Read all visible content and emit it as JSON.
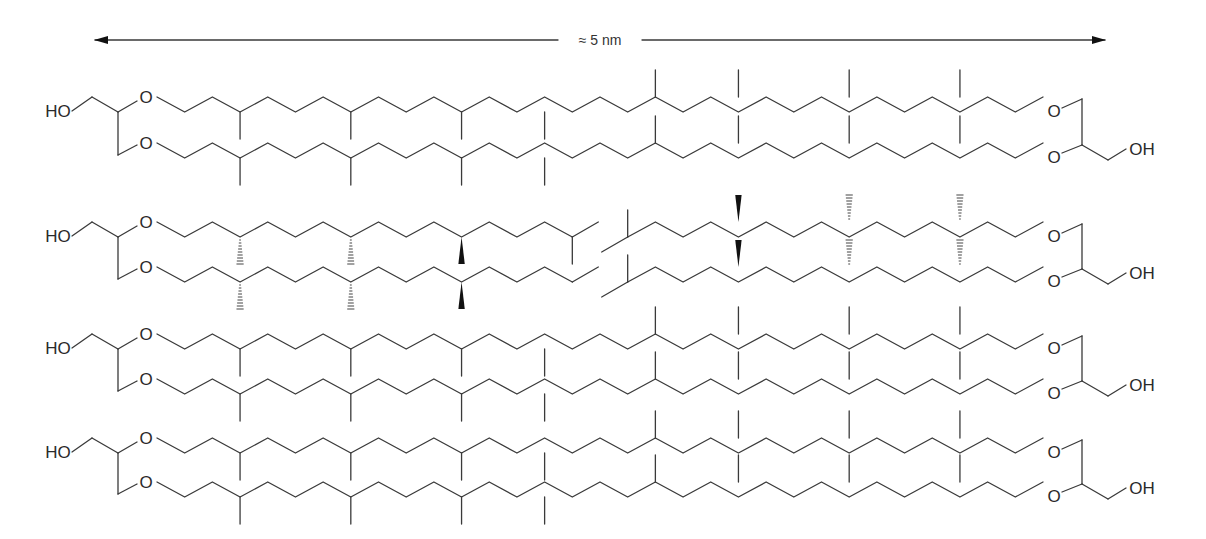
{
  "diagram": {
    "type": "chemical-structure",
    "scale_bar": {
      "label": "≈ 5 nm",
      "x1": 95,
      "x2": 1105,
      "y": 40,
      "label_x": 600
    },
    "colors": {
      "bond": "#3a3a3a",
      "text": "#2a2a2a",
      "background": "#ffffff"
    },
    "geometry": {
      "step_x": 27.4,
      "amplitude": 15,
      "branch_length": 27
    },
    "rows": [
      {
        "id": "row-1",
        "name": "caldarchaeol-like tetraether",
        "left_label": "HO",
        "right_label": "OH",
        "ether_label": "O",
        "top_chain_y": 97,
        "bottom_chain_y": 143,
        "left_x": 147,
        "right_x": 1055,
        "stereo": "none",
        "split": false
      },
      {
        "id": "row-2",
        "name": "archaeol diethers with stereochemistry",
        "left_label": "HO",
        "right_label": "OH",
        "ether_label": "O",
        "top_chain_y": 222,
        "bottom_chain_y": 267,
        "left_x": 147,
        "right_x": 1055,
        "stereo": "wedge-hash",
        "split": true,
        "split_left_end": 587,
        "split_right_start": 617
      },
      {
        "id": "row-3",
        "name": "caldarchaeol-like tetraether",
        "left_label": "HO",
        "right_label": "OH",
        "ether_label": "O",
        "top_chain_y": 334,
        "bottom_chain_y": 379,
        "left_x": 147,
        "right_x": 1055,
        "stereo": "none",
        "split": false
      },
      {
        "id": "row-4",
        "name": "caldarchaeol-like tetraether",
        "left_label": "HO",
        "right_label": "OH",
        "ether_label": "O",
        "top_chain_y": 438,
        "bottom_chain_y": 482,
        "left_x": 147,
        "right_x": 1055,
        "stereo": "none",
        "split": false
      }
    ]
  }
}
